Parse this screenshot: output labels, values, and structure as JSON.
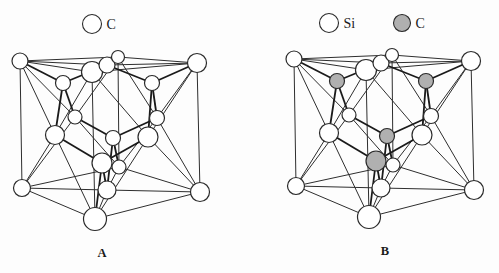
{
  "figure": {
    "background": "#fdfdfd",
    "colors": {
      "line": "#2e2e2e",
      "bond": "#1a1a1a",
      "atom_stroke": "#2a2a2a",
      "white_fill": "#ffffff",
      "gray_fill": "#b0b0b0",
      "text": "#1a1a1a"
    }
  },
  "lattice": {
    "atoms": [
      {
        "id": "corner-top-left",
        "x": 20,
        "y": 61,
        "r": 8,
        "site": "fcc"
      },
      {
        "id": "corner-top-back",
        "x": 118,
        "y": 57,
        "r": 6.5,
        "site": "fcc"
      },
      {
        "id": "corner-top-right",
        "x": 197,
        "y": 63,
        "r": 9.5,
        "site": "fcc"
      },
      {
        "id": "corner-top-front",
        "x": 92,
        "y": 72,
        "r": 10.5,
        "site": "fcc"
      },
      {
        "id": "corner-bottom-left",
        "x": 22,
        "y": 188,
        "r": 8.5,
        "site": "fcc"
      },
      {
        "id": "corner-bottom-back",
        "x": 119,
        "y": 167,
        "r": 7,
        "site": "fcc"
      },
      {
        "id": "corner-bottom-right",
        "x": 200,
        "y": 192,
        "r": 9.5,
        "site": "fcc"
      },
      {
        "id": "corner-bottom-front",
        "x": 95,
        "y": 219,
        "r": 11.5,
        "site": "fcc"
      },
      {
        "id": "face-center-top",
        "x": 107,
        "y": 65,
        "r": 8,
        "site": "fcc"
      },
      {
        "id": "face-center-back-left",
        "x": 75,
        "y": 117,
        "r": 7,
        "site": "fcc"
      },
      {
        "id": "face-center-back-right",
        "x": 157,
        "y": 118,
        "r": 7.5,
        "site": "fcc"
      },
      {
        "id": "face-center-left-front",
        "x": 55,
        "y": 135,
        "r": 9.5,
        "site": "fcc"
      },
      {
        "id": "face-center-right-front",
        "x": 148,
        "y": 137,
        "r": 10,
        "site": "fcc"
      },
      {
        "id": "face-center-bottom",
        "x": 107,
        "y": 190,
        "r": 9,
        "site": "fcc"
      },
      {
        "id": "interior-upper-left",
        "x": 63,
        "y": 83,
        "r": 7.5,
        "site": "interior"
      },
      {
        "id": "interior-upper-right",
        "x": 152,
        "y": 83,
        "r": 7.5,
        "site": "interior"
      },
      {
        "id": "interior-middle",
        "x": 113,
        "y": 138,
        "r": 7.5,
        "site": "interior"
      },
      {
        "id": "interior-lower-front",
        "x": 102,
        "y": 163,
        "r": 10,
        "site": "interior"
      }
    ],
    "cube_edges": [
      [
        0,
        1
      ],
      [
        1,
        2
      ],
      [
        2,
        3
      ],
      [
        3,
        0
      ],
      [
        4,
        5
      ],
      [
        5,
        6
      ],
      [
        6,
        7
      ],
      [
        7,
        4
      ],
      [
        0,
        4
      ],
      [
        1,
        5
      ],
      [
        2,
        6
      ],
      [
        3,
        7
      ]
    ],
    "face_lines": [
      [
        8,
        0
      ],
      [
        8,
        1
      ],
      [
        8,
        2
      ],
      [
        8,
        3
      ],
      [
        9,
        0
      ],
      [
        9,
        1
      ],
      [
        9,
        4
      ],
      [
        9,
        5
      ],
      [
        10,
        1
      ],
      [
        10,
        2
      ],
      [
        10,
        5
      ],
      [
        10,
        6
      ],
      [
        11,
        0
      ],
      [
        11,
        3
      ],
      [
        11,
        4
      ],
      [
        11,
        7
      ],
      [
        12,
        2
      ],
      [
        12,
        3
      ],
      [
        12,
        6
      ],
      [
        12,
        7
      ],
      [
        13,
        4
      ],
      [
        13,
        5
      ],
      [
        13,
        6
      ],
      [
        13,
        7
      ]
    ],
    "bonds": [
      [
        14,
        0
      ],
      [
        14,
        8
      ],
      [
        14,
        9
      ],
      [
        14,
        11
      ],
      [
        15,
        2
      ],
      [
        15,
        8
      ],
      [
        15,
        10
      ],
      [
        15,
        12
      ],
      [
        16,
        5
      ],
      [
        16,
        9
      ],
      [
        16,
        10
      ],
      [
        16,
        13
      ],
      [
        17,
        7
      ],
      [
        17,
        11
      ],
      [
        17,
        12
      ],
      [
        17,
        13
      ]
    ],
    "paint_order": [
      3,
      8,
      1,
      0,
      2,
      4,
      5,
      6,
      7,
      9,
      10,
      11,
      12,
      13,
      14,
      15,
      16,
      17
    ]
  },
  "structures": [
    {
      "label": "A",
      "dx": 0,
      "dy": 0,
      "interior_fill": "white",
      "label_x": 102,
      "label_y": 257,
      "legend": [
        {
          "symbol": "C",
          "fill": "white",
          "cx": 92,
          "cy": 24,
          "r": 9.5
        }
      ]
    },
    {
      "label": "B",
      "dx": 274,
      "dy": -2,
      "interior_fill": "gray",
      "label_x": 385,
      "label_y": 255,
      "legend": [
        {
          "symbol": "Si",
          "fill": "white",
          "cx": 329,
          "cy": 23,
          "r": 9.5
        },
        {
          "symbol": "C",
          "fill": "gray",
          "cx": 402,
          "cy": 23,
          "r": 8.5
        }
      ]
    }
  ]
}
